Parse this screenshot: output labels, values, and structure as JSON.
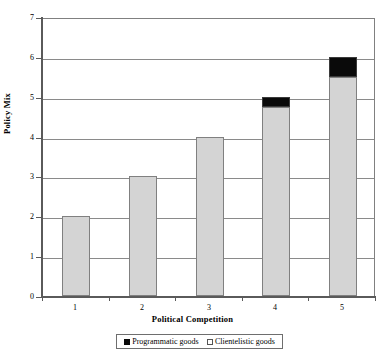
{
  "chart_data": {
    "type": "bar",
    "subtype": "stacked-column",
    "title": "",
    "xlabel": "Political Competition",
    "ylabel": "Policy Mix",
    "categories": [
      "1",
      "2",
      "3",
      "4",
      "5"
    ],
    "series": [
      {
        "name": "Clientelistic goods",
        "color": "#d4d4d4",
        "values": [
          2,
          3,
          4,
          4.75,
          5.5
        ]
      },
      {
        "name": "Programmatic goods",
        "color": "#000000",
        "values": [
          0,
          0,
          0,
          0.25,
          0.5
        ]
      }
    ],
    "totals": [
      2,
      3,
      4,
      5,
      6
    ],
    "ylim": [
      0,
      7
    ],
    "ytick_labels": [
      "0",
      "1",
      "2",
      "3",
      "4",
      "5",
      "6",
      "7"
    ],
    "ytick_values": [
      0,
      1,
      2,
      3,
      4,
      5,
      6,
      7
    ],
    "grid": true,
    "grid_axis": "y",
    "legend_position": "bottom",
    "legend_entries": [
      "Programmatic goods",
      "Clientelistic goods"
    ]
  },
  "axes": {
    "y_title": "Policy Mix",
    "x_title": "Political Competition"
  },
  "legend": {
    "items": [
      {
        "label": "Programmatic goods",
        "marker": "filled-square-icon"
      },
      {
        "label": "Clientelistic goods",
        "marker": "empty-square-icon"
      }
    ]
  },
  "colors": {
    "clientelistic": "#d4d4d4",
    "programmatic": "#000000",
    "gridline": "#8a8a8a",
    "axis": "#5a5a5a",
    "background": "#ffffff"
  }
}
